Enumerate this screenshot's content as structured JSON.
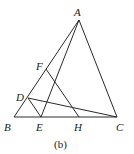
{
  "figure": {
    "caption": "(b)",
    "points": {
      "A": {
        "label": "A",
        "x": 79,
        "y": 20
      },
      "B": {
        "label": "B",
        "x": 14,
        "y": 117
      },
      "C": {
        "label": "C",
        "x": 117,
        "y": 117
      },
      "D": {
        "label": "D",
        "x": 28,
        "y": 98
      },
      "E": {
        "label": "E",
        "x": 41,
        "y": 117
      },
      "F": {
        "label": "F",
        "x": 46,
        "y": 69
      },
      "H": {
        "label": "H",
        "x": 79,
        "y": 117
      }
    },
    "segments": [
      [
        "A",
        "B"
      ],
      [
        "A",
        "C"
      ],
      [
        "B",
        "C"
      ],
      [
        "A",
        "E"
      ],
      [
        "D",
        "C"
      ],
      [
        "D",
        "E"
      ],
      [
        "F",
        "H"
      ]
    ],
    "stroke_color": "#2a2a2a"
  }
}
